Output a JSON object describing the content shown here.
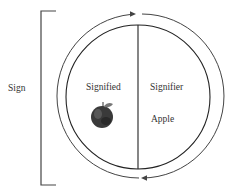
{
  "diagram": {
    "title": "",
    "labels": {
      "sign": "Sign",
      "signified": "Signified",
      "signifier": "Signifier",
      "signifier_word": "Apple"
    },
    "image": {
      "signified_image": "apple-image"
    },
    "structure": {
      "bracket": "encloses the whole sign",
      "outer_ring": "two arrows indicating bidirectional relation (clockwise arrow at top, counter-clockwise arrow at bottom)",
      "inner_circle": "divided vertically into Signified (left) and Signifier (right)"
    },
    "colors": {
      "stroke": "#333333",
      "background": "#ffffff"
    }
  }
}
